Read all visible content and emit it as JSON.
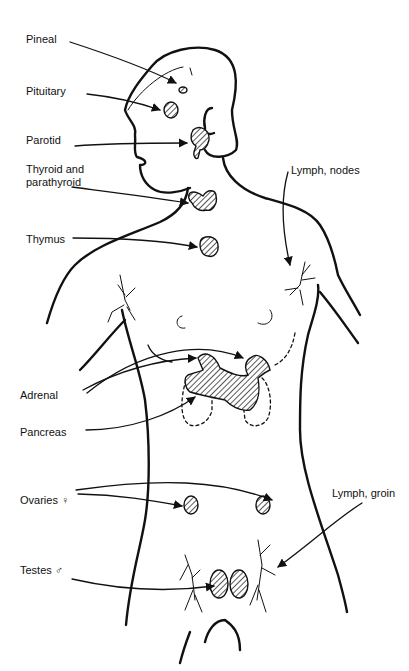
{
  "figure": {
    "labels": {
      "pineal": "Pineal",
      "pituitary": "Pituitary",
      "parotid": "Parotid",
      "thyroid": "Thyroid and",
      "thyroid_line2": "parathyroid",
      "thymus": "Thymus",
      "lymph_nodes": "Lymph, nodes",
      "adrenal": "Adrenal",
      "pancreas": "Pancreas",
      "ovaries": "Ovaries ♀",
      "lymph_groin": "Lymph, groin",
      "testes": "Testes ♂"
    },
    "colors": {
      "ink": "#111111",
      "background": "#ffffff"
    }
  }
}
